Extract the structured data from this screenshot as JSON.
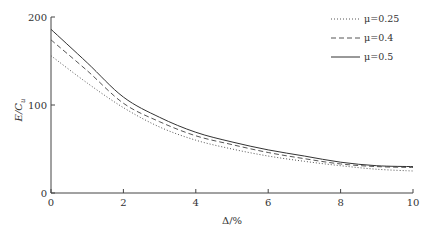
{
  "chart_data": {
    "type": "line",
    "title": "",
    "xlabel": "Δ/%",
    "ylabel": "E/C_u",
    "xlim": [
      0,
      10
    ],
    "ylim": [
      0,
      200
    ],
    "xticks": [
      0,
      2,
      4,
      6,
      8,
      10
    ],
    "yticks": [
      0,
      100,
      200
    ],
    "grid": false,
    "legend_position": "upper right",
    "x": [
      0,
      1,
      2,
      3,
      4,
      5,
      6,
      7,
      8,
      9,
      10
    ],
    "series": [
      {
        "name": "μ=0.25",
        "style": "dotted",
        "values": [
          156,
          125,
          97,
          75,
          60,
          50,
          42,
          36,
          31,
          27,
          25
        ]
      },
      {
        "name": "μ=0.4",
        "style": "dashed",
        "values": [
          174,
          139,
          102,
          81,
          65,
          55,
          46,
          39,
          33,
          30,
          29
        ]
      },
      {
        "name": "μ=0.5",
        "style": "solid",
        "values": [
          186,
          148,
          109,
          86,
          69,
          58,
          49,
          42,
          35,
          31,
          30
        ]
      }
    ]
  },
  "axes": {
    "x_title": "Δ/%",
    "y_title_main": "E",
    "y_title_sep": "/",
    "y_title_c": "C",
    "y_title_sub": "u",
    "x_tick_labels": [
      "0",
      "2",
      "4",
      "6",
      "8",
      "10"
    ],
    "y_tick_labels": [
      "0",
      "100",
      "200"
    ]
  },
  "legend": {
    "items": [
      {
        "label": "μ=0.25"
      },
      {
        "label": "μ=0.4"
      },
      {
        "label": "μ=0.5"
      }
    ]
  }
}
